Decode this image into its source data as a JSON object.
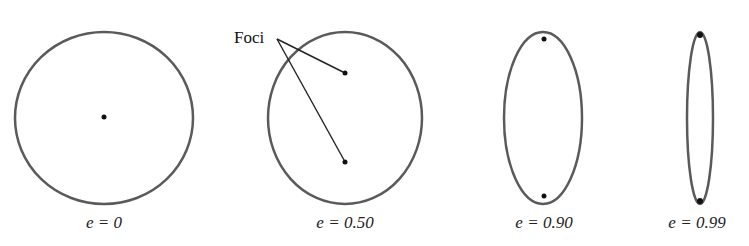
{
  "diagram": {
    "stroke_color": "#5a5a5a",
    "focus_color": "#111111",
    "annotation": {
      "label": "Foci",
      "anchor": [
        277,
        39
      ],
      "targets": [
        [
          345,
          73
        ],
        [
          345,
          162
        ]
      ]
    },
    "ellipses": [
      {
        "label": "e = 0",
        "eccentricity": 0,
        "cx": 104,
        "cy": 118,
        "rx": 89,
        "ry": 86,
        "foci": [
          [
            104,
            117
          ]
        ]
      },
      {
        "label": "e = 0.50",
        "eccentricity": 0.5,
        "cx": 345,
        "cy": 118,
        "rx": 77,
        "ry": 86,
        "foci": [
          [
            345,
            73
          ],
          [
            345,
            162
          ]
        ]
      },
      {
        "label": "e = 0.90",
        "eccentricity": 0.9,
        "cx": 543,
        "cy": 118,
        "rx": 39,
        "ry": 86,
        "foci": [
          [
            544,
            39
          ],
          [
            544,
            196
          ]
        ]
      },
      {
        "label": "e = 0.99",
        "eccentricity": 0.99,
        "cx": 700,
        "cy": 118,
        "rx": 13,
        "ry": 86,
        "foci": [
          [
            700,
            35
          ],
          [
            700,
            201
          ]
        ]
      }
    ]
  }
}
